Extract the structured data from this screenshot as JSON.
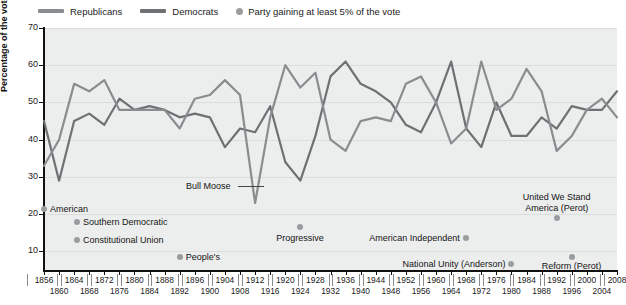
{
  "legend": {
    "items": [
      {
        "label": "Republicans",
        "type": "line",
        "color": "#8a8d8f"
      },
      {
        "label": "Democrats",
        "type": "line",
        "color": "#6e7173"
      },
      {
        "label": "Party gaining at least 5% of the vote",
        "type": "dot",
        "color": "#9a9d9f"
      }
    ]
  },
  "axes": {
    "ylabel": "Percentage of the vote",
    "yticks": [
      10,
      20,
      30,
      40,
      50,
      60,
      70
    ],
    "ylim": [
      5,
      70
    ],
    "xlim": [
      1856,
      2008
    ]
  },
  "chart_data": {
    "type": "line",
    "title": "",
    "xlabel": "",
    "ylabel": "Percentage of the vote",
    "ylim": [
      5,
      70
    ],
    "xlim": [
      1856,
      2008
    ],
    "grid": true,
    "legend_position": "top-left",
    "x": [
      1856,
      1860,
      1864,
      1868,
      1872,
      1876,
      1880,
      1884,
      1888,
      1892,
      1896,
      1900,
      1904,
      1908,
      1912,
      1916,
      1920,
      1924,
      1928,
      1932,
      1936,
      1940,
      1944,
      1948,
      1952,
      1956,
      1960,
      1964,
      1968,
      1972,
      1976,
      1980,
      1984,
      1988,
      1992,
      1996,
      2000,
      2004,
      2008
    ],
    "series": [
      {
        "name": "Republicans",
        "color": "#8a8d8f",
        "values": [
          33,
          40,
          55,
          53,
          56,
          48,
          48,
          48,
          48,
          43,
          51,
          52,
          56,
          52,
          23,
          46,
          60,
          54,
          58,
          40,
          37,
          45,
          46,
          45,
          55,
          57,
          50,
          39,
          43,
          61,
          48,
          51,
          59,
          53,
          37,
          41,
          48,
          51,
          46
        ]
      },
      {
        "name": "Democrats",
        "color": "#6e7173",
        "values": [
          45,
          29,
          45,
          47,
          44,
          51,
          48,
          49,
          48,
          46,
          47,
          46,
          38,
          43,
          42,
          49,
          34,
          29,
          41,
          57,
          61,
          55,
          53,
          50,
          44,
          42,
          50,
          61,
          43,
          38,
          50,
          41,
          41,
          46,
          43,
          49,
          48,
          48,
          53
        ]
      }
    ],
    "third_party_points": [
      {
        "label": "American",
        "year": 1856,
        "value": 21.5
      },
      {
        "label": "Southern Democratic",
        "year": 1860,
        "value": 18
      },
      {
        "label": "Constitutional Union",
        "year": 1860,
        "value": 13
      },
      {
        "label": "People's",
        "year": 1892,
        "value": 8.5
      },
      {
        "label": "Bull Moose",
        "year": 1912,
        "value": 27.4
      },
      {
        "label": "Progressive",
        "year": 1924,
        "value": 16.6
      },
      {
        "label": "American Independent",
        "year": 1968,
        "value": 13.5
      },
      {
        "label": "National Unity (Anderson)",
        "year": 1980,
        "value": 6.6
      },
      {
        "label": "United We Stand America (Perot)",
        "year": 1992,
        "value": 18.9
      },
      {
        "label": "Reform (Perot)",
        "year": 1996,
        "value": 8.4
      }
    ]
  },
  "xaxis_labels_row1": [
    1856,
    1864,
    1872,
    1880,
    1888,
    1896,
    1904,
    1912,
    1920,
    1928,
    1936,
    1944,
    1952,
    1960,
    1968,
    1976,
    1984,
    1992,
    2000,
    2008
  ],
  "xaxis_labels_row2": [
    1860,
    1868,
    1876,
    1884,
    1892,
    1900,
    1908,
    1916,
    1924,
    1932,
    1940,
    1948,
    1956,
    1964,
    1972,
    1980,
    1988,
    1996,
    2004
  ]
}
